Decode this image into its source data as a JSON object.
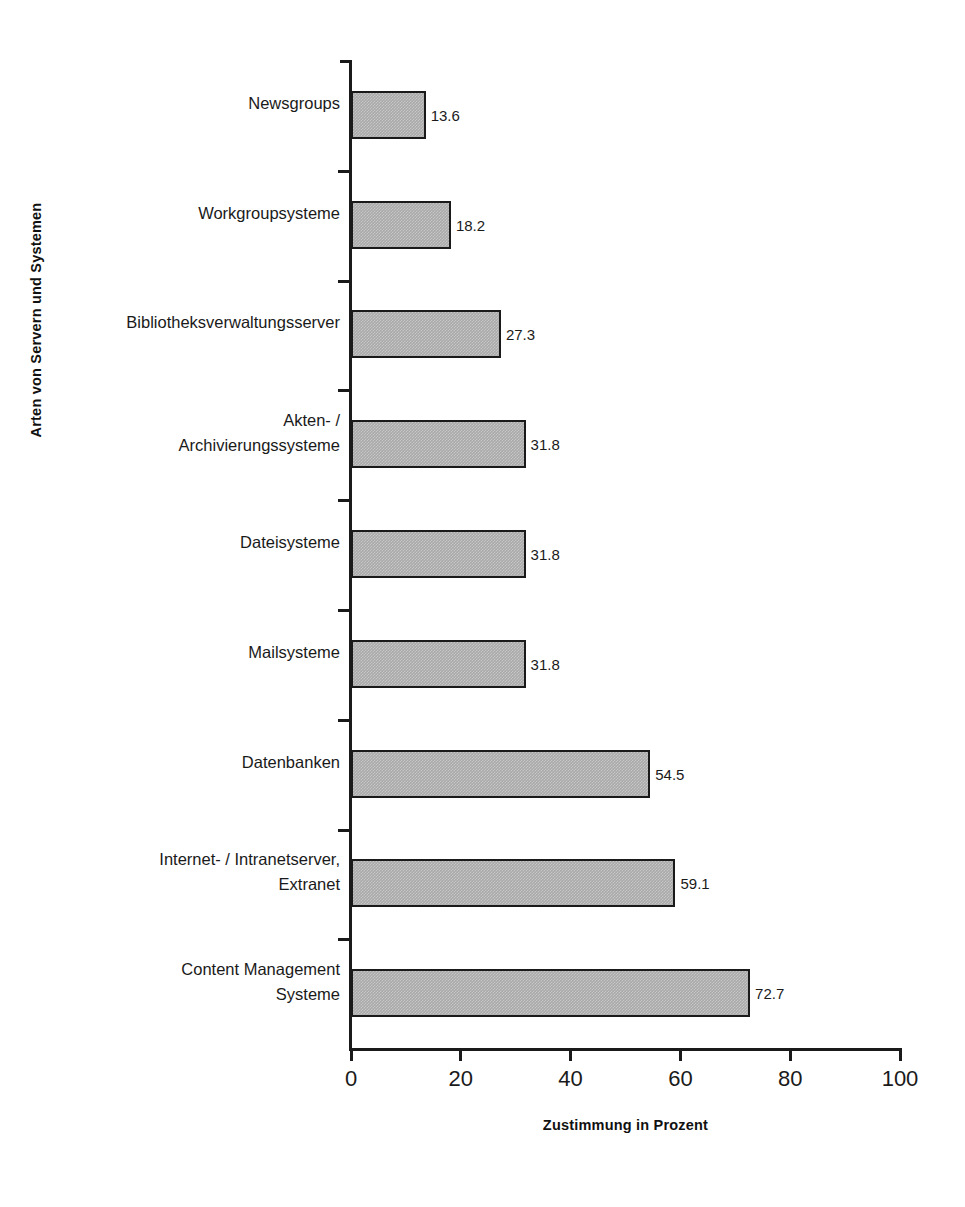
{
  "chart_data": {
    "type": "bar",
    "orientation": "horizontal",
    "title": "",
    "xlabel": "Zustimmung in Prozent",
    "ylabel": "Arten von Servern und Systemen",
    "xlim": [
      0,
      100
    ],
    "xticks": [
      "0",
      "20",
      "40",
      "60",
      "80",
      "100"
    ],
    "grid": false,
    "legend": null,
    "categories": [
      "Newsgroups",
      "Workgroupsysteme",
      "Bibliotheksverwaltungsserver",
      "Akten- /\nArchivierungssysteme",
      "Dateisysteme",
      "Mailsysteme",
      "Datenbanken",
      "Internet- / Intranetserver,\nExtranet",
      "Content Management\nSysteme"
    ],
    "values": [
      13.6,
      18.2,
      27.3,
      31.8,
      31.8,
      31.8,
      54.5,
      59.1,
      72.7
    ],
    "value_labels": [
      "13.6",
      "18.2",
      "27.3",
      "31.8",
      "31.8",
      "31.8",
      "54.5",
      "59.1",
      "72.7"
    ],
    "bar_fill_color": "#a9a9a9",
    "bar_edge_color": "#1a1a1a",
    "background_color": "#ffffff"
  }
}
